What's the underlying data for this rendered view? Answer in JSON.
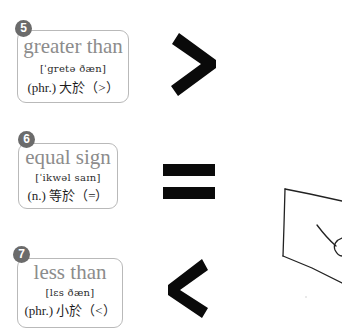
{
  "cards": [
    {
      "number": "5",
      "word": "greater than",
      "phonetic": "[ˈgretə ðæn]",
      "definition": "(phr.) 大於（>）",
      "symbol": ">"
    },
    {
      "number": "6",
      "word": "equal sign",
      "phonetic": "[ˈikwəl saɪn]",
      "definition": "(n.) 等於（=）",
      "symbol": "="
    },
    {
      "number": "7",
      "word": "less than",
      "phonetic": "[lɛs ðæn]",
      "definition": "(phr.) 小於（<）",
      "symbol": "<"
    }
  ],
  "colors": {
    "badge": "#6b6b6b",
    "word": "#8c8c8c",
    "symbol": "#0a0a0a",
    "border": "#b9b9b9"
  }
}
